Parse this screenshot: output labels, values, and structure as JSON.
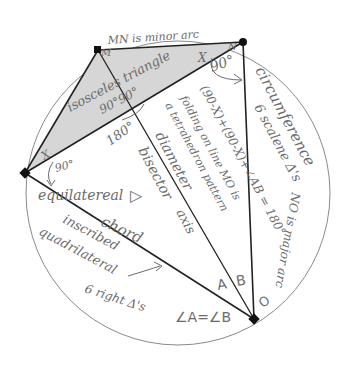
{
  "diagram": {
    "type": "circle-geometry-sketch",
    "colors": {
      "background": "#ffffff",
      "circle": "#8a8a8a",
      "chord": "#222222",
      "shaded_triangle": "#d6d6d6",
      "handwriting": "#6b6b6b"
    },
    "points": {
      "M": {
        "label": "M",
        "x": 98,
        "y": 50
      },
      "N": {
        "label": "N",
        "x": 243,
        "y": 42
      },
      "L": {
        "label": "",
        "x": 25,
        "y": 173
      },
      "O": {
        "label": "O",
        "x": 254,
        "y": 319
      }
    },
    "labels": {
      "minor_arc": "MN is minor arc",
      "isosceles": "isosceles triangle",
      "angle_90_90": "90°90°",
      "angle_x_top": "X",
      "angle_90_top": "90°",
      "angle_x_left": "X",
      "angle_90_left": "90°",
      "angle_180": "180°",
      "circumference": "circumference",
      "scalene": "6 scalene Δ's",
      "sum_expr": "(90-X)+(90-X)+∠AB = 180°",
      "folding": "folding on line MO is",
      "tetrahedron": "a tetrahedron pattern",
      "diameter": "diameter",
      "bisector": "bisector",
      "axis": "axis",
      "equilateral": "equilatereal",
      "triangle_symbol": "▷",
      "chord": "chord",
      "inscribed": "inscribed",
      "quadrilateral": "quadrilateral",
      "major_arc": "NO is major arc",
      "right_triangles": "6 right Δ's",
      "angle_A": "A",
      "angle_B": "B",
      "angle_eq": "∠A=∠B",
      "point_O": "O",
      "point_M": "M",
      "point_N": "N"
    }
  }
}
